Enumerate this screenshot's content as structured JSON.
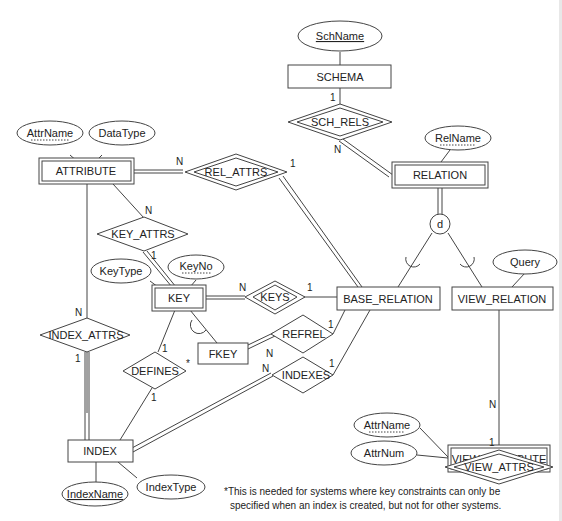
{
  "diagram": {
    "type": "EER schema of a relational catalog",
    "entities": [
      {
        "id": "schema",
        "label": "SCHEMA",
        "weak": false
      },
      {
        "id": "relation",
        "label": "RELATION",
        "weak": true
      },
      {
        "id": "attribute",
        "label": "ATTRIBUTE",
        "weak": true
      },
      {
        "id": "key",
        "label": "KEY",
        "weak": true
      },
      {
        "id": "base_relation",
        "label": "BASE_RELATION",
        "weak": false
      },
      {
        "id": "view_relation",
        "label": "VIEW_RELATION",
        "weak": false
      },
      {
        "id": "fkey",
        "label": "FKEY",
        "weak": false
      },
      {
        "id": "index",
        "label": "INDEX",
        "weak": false
      },
      {
        "id": "view_attribute",
        "label": "VIEW_ATTRIBUTE",
        "weak": true
      }
    ],
    "relationships": [
      {
        "id": "sch_rels",
        "label": "SCH_RELS",
        "identifying": true,
        "card1": "1",
        "card2": "N"
      },
      {
        "id": "rel_attrs",
        "label": "REL_ATTRS",
        "identifying": true,
        "card1": "N",
        "card2": "1"
      },
      {
        "id": "key_attrs",
        "label": "KEY_ATTRS",
        "identifying": false,
        "card1": "N",
        "card2": "1"
      },
      {
        "id": "keys",
        "label": "KEYS",
        "identifying": true,
        "card1": "N",
        "card2": "1"
      },
      {
        "id": "refrel",
        "label": "REFREL",
        "identifying": false,
        "card1": "N",
        "card2": "1"
      },
      {
        "id": "index_attrs",
        "label": "INDEX_ATTRS",
        "identifying": false,
        "card1": "N",
        "card2": "1"
      },
      {
        "id": "defines",
        "label": "DEFINES",
        "identifying": false,
        "card1": "1",
        "card2": "1",
        "marker": "*"
      },
      {
        "id": "indexes",
        "label": "INDEXES",
        "identifying": false,
        "card1": "N",
        "card2": "1"
      },
      {
        "id": "view_attrs",
        "label": "VIEW_ATTRS",
        "identifying": true,
        "card1": "1",
        "card2": "N"
      }
    ],
    "attributes": {
      "schname": {
        "label": "SchName",
        "key": "full"
      },
      "relname": {
        "label": "RelName",
        "key": "partial"
      },
      "attrname": {
        "label": "AttrName",
        "key": "partial"
      },
      "datatype": {
        "label": "DataType",
        "key": "none"
      },
      "keytype": {
        "label": "KeyType",
        "key": "none"
      },
      "keyno": {
        "label": "KeyNo",
        "key": "partial"
      },
      "query": {
        "label": "Query",
        "key": "none"
      },
      "indexname": {
        "label": "IndexName",
        "key": "full"
      },
      "indextype": {
        "label": "IndexType",
        "key": "none"
      },
      "v_attrname": {
        "label": "AttrName",
        "key": "partial"
      },
      "v_attrnum": {
        "label": "AttrNum",
        "key": "none"
      }
    },
    "specialization": {
      "symbol": "d"
    },
    "footnote": {
      "line1": "*This is needed for systems where key constraints can only be",
      "line2": "specified when an index is created, but not for other systems."
    }
  }
}
